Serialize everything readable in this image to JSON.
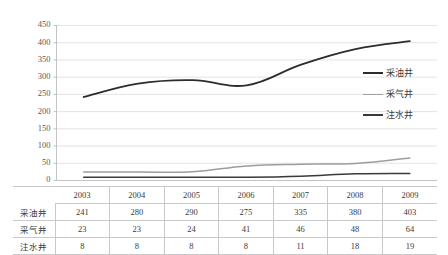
{
  "chart_data": {
    "type": "line",
    "title": "",
    "xlabel": "",
    "ylabel": "",
    "categories": [
      "2003",
      "2004",
      "2005",
      "2006",
      "2007",
      "2008",
      "2009"
    ],
    "ylim": [
      0,
      450
    ],
    "ytick_step": 50,
    "yticks": [
      "450",
      "400",
      "350",
      "300",
      "250",
      "200",
      "150",
      "100",
      "50",
      "0"
    ],
    "grid": true,
    "legend_position": "right",
    "smoothed": true,
    "series": [
      {
        "name": "采油井",
        "color": "#2c2c2c",
        "width": 1.8,
        "values": [
          241,
          280,
          290,
          275,
          335,
          380,
          403
        ]
      },
      {
        "name": "采气井",
        "color": "#9d9d9f",
        "width": 1.5,
        "values": [
          23,
          23,
          24,
          41,
          46,
          48,
          64
        ]
      },
      {
        "name": "注水井",
        "color": "#3a3a3a",
        "width": 1.5,
        "values": [
          8,
          8,
          8,
          8,
          11,
          18,
          19
        ]
      }
    ]
  },
  "table": {
    "corner_label": "",
    "column_headers": [
      "2003",
      "2004",
      "2005",
      "2006",
      "2007",
      "2008",
      "2009"
    ],
    "rows": [
      {
        "label": "采油井",
        "values": [
          "241",
          "280",
          "290",
          "275",
          "335",
          "380",
          "403"
        ]
      },
      {
        "label": "采气井",
        "values": [
          "23",
          "23",
          "24",
          "41",
          "46",
          "48",
          "64"
        ]
      },
      {
        "label": "注水井",
        "values": [
          "8",
          "8",
          "8",
          "8",
          "11",
          "18",
          "19"
        ]
      }
    ]
  },
  "legend": {
    "items": [
      {
        "label": "采油井",
        "color": "#2c2c2c",
        "thickness": "2px"
      },
      {
        "label": "采气井",
        "color": "#a0a0a2",
        "thickness": "1.6px"
      },
      {
        "label": "注水井",
        "color": "#3a3a3a",
        "thickness": "2px"
      }
    ]
  },
  "colors": {
    "gridline": "#d7d7d9",
    "axis": "#b4b4b6",
    "background": "#ffffff",
    "text": "#3b3b3b"
  }
}
